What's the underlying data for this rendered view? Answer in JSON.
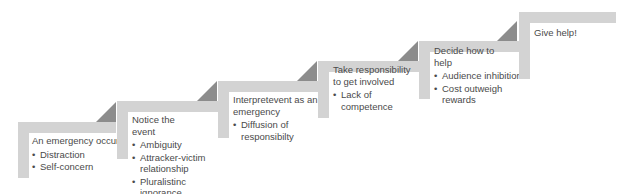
{
  "diagram": {
    "type": "staircase-process",
    "colors": {
      "bar": "#d3d3d3",
      "arrow": "#8c8c8c",
      "text": "#4a4a4a"
    },
    "steps": [
      {
        "title": "An emergency occurs!",
        "barriers": [
          "Distraction",
          "Self-concern"
        ]
      },
      {
        "title": "Notice the event",
        "barriers": [
          "Ambiguity",
          "Attracker-victim relationship",
          "Pluralistinc ignorance"
        ]
      },
      {
        "title": "Interpretevent as an emergency",
        "barriers": [
          "Diffusion of responsibilty"
        ]
      },
      {
        "title": "Take responsibility to get involved",
        "barriers": [
          "Lack of competence"
        ]
      },
      {
        "title": "Decide how to help",
        "barriers": [
          "Audience inhibition",
          "Cost outweigh rewards"
        ]
      },
      {
        "title": "Give help!",
        "barriers": []
      }
    ]
  }
}
